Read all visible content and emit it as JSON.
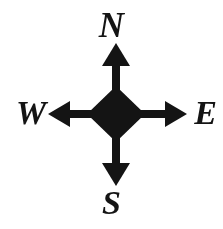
{
  "figure": {
    "name": "compass-rose",
    "background_color": "#ffffff",
    "ink_color": "#141414"
  },
  "labels": {
    "north": "N",
    "east": "E",
    "south": "S",
    "west": "W"
  },
  "geometry": {
    "center_x": 116,
    "center_y": 114,
    "diamond_half_diagonal": 27,
    "shaft_half_width": 4,
    "head_half_width": 13,
    "head_length": 19,
    "arrow_tip_north_y": 43,
    "arrow_tip_south_y": 186,
    "arrow_tip_west_x": 48,
    "arrow_tip_east_x": 187
  }
}
